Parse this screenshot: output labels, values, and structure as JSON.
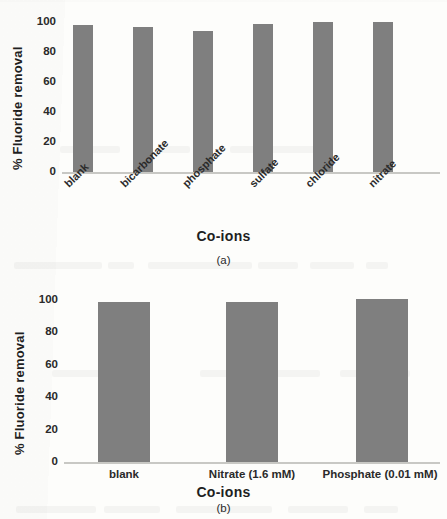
{
  "figure": {
    "panels": [
      {
        "id": "a",
        "caption": "(a)",
        "ylabel": "% Fluoride removal",
        "xlabel": "Co-ions",
        "bar_color": "#7f7f7f",
        "yticks": [
          "100",
          "80",
          "60",
          "40",
          "20",
          "0"
        ],
        "categories": [
          "blank",
          "bicarbonate",
          "phosphate",
          "sulfate",
          "chloride",
          "nitrate"
        ],
        "values": [
          98,
          97,
          94,
          98.5,
          100,
          100
        ]
      },
      {
        "id": "b",
        "caption": "(b)",
        "ylabel": "% Fluoride removal",
        "xlabel": "Co-ions",
        "bar_color": "#7f7f7f",
        "yticks": [
          "100",
          "80",
          "60",
          "40",
          "20",
          "0"
        ],
        "categories": [
          "blank",
          "Nitrate (1.6 mM)",
          "Phosphate (0.01 mM)"
        ],
        "values": [
          98.5,
          99,
          100.5
        ]
      }
    ]
  },
  "chart_data": [
    {
      "type": "bar",
      "panel": "(a)",
      "title": "",
      "xlabel": "Co-ions",
      "ylabel": "% Fluoride removal",
      "categories": [
        "blank",
        "bicarbonate",
        "phosphate",
        "sulfate",
        "chloride",
        "nitrate"
      ],
      "values": [
        98,
        97,
        94,
        98.5,
        100,
        100
      ],
      "yticks": [
        0,
        20,
        40,
        60,
        80,
        100
      ],
      "ylim": [
        0,
        100
      ],
      "grid": false,
      "legend": "none",
      "bar_color": "#7f7f7f",
      "xtick_rotation": 45
    },
    {
      "type": "bar",
      "panel": "(b)",
      "title": "",
      "xlabel": "Co-ions",
      "ylabel": "% Fluoride removal",
      "categories": [
        "blank",
        "Nitrate (1.6 mM)",
        "Phosphate (0.01 mM)"
      ],
      "values": [
        98.5,
        99,
        100.5
      ],
      "yticks": [
        0,
        20,
        40,
        60,
        80,
        100
      ],
      "ylim": [
        0,
        100
      ],
      "grid": false,
      "legend": "none",
      "bar_color": "#7f7f7f",
      "xtick_rotation": 0
    }
  ]
}
